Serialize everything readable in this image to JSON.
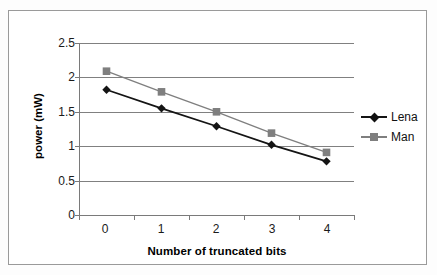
{
  "chart_data": {
    "type": "line",
    "title": "",
    "xlabel": "Number of truncated bits",
    "ylabel": "power (mW)",
    "categories": [
      "0",
      "1",
      "2",
      "3",
      "4"
    ],
    "x": [
      0,
      1,
      2,
      3,
      4
    ],
    "ylim": [
      0,
      2.5
    ],
    "yticks": [
      "0",
      "0.5",
      "1",
      "1.5",
      "2",
      "2.5"
    ],
    "ytick_values": [
      0,
      0.5,
      1,
      1.5,
      2,
      2.5
    ],
    "grid": "horizontal",
    "legend_position": "right",
    "series": [
      {
        "name": "Lena",
        "marker": "diamond",
        "color": "#141414",
        "values": [
          1.82,
          1.55,
          1.29,
          1.02,
          0.78
        ]
      },
      {
        "name": "Man",
        "marker": "square",
        "color": "#7f7f7f",
        "values": [
          2.09,
          1.79,
          1.5,
          1.19,
          0.91
        ]
      }
    ]
  },
  "legend": {
    "items": [
      {
        "label": "Lena"
      },
      {
        "label": "Man"
      }
    ]
  },
  "axes": {
    "y_title": "power (mW)",
    "x_title": "Number of truncated bits",
    "y_tick_labels": [
      "2.5",
      "2",
      "1.5",
      "1",
      "0.5",
      "0"
    ],
    "x_tick_labels": [
      "0",
      "1",
      "2",
      "3",
      "4"
    ]
  },
  "colors": {
    "series_lena": "#141414",
    "series_man": "#7f7f7f",
    "gridline": "#808080",
    "axis": "#7a7a7a",
    "frame": "#9a9a9a",
    "background": "#ffffff"
  }
}
